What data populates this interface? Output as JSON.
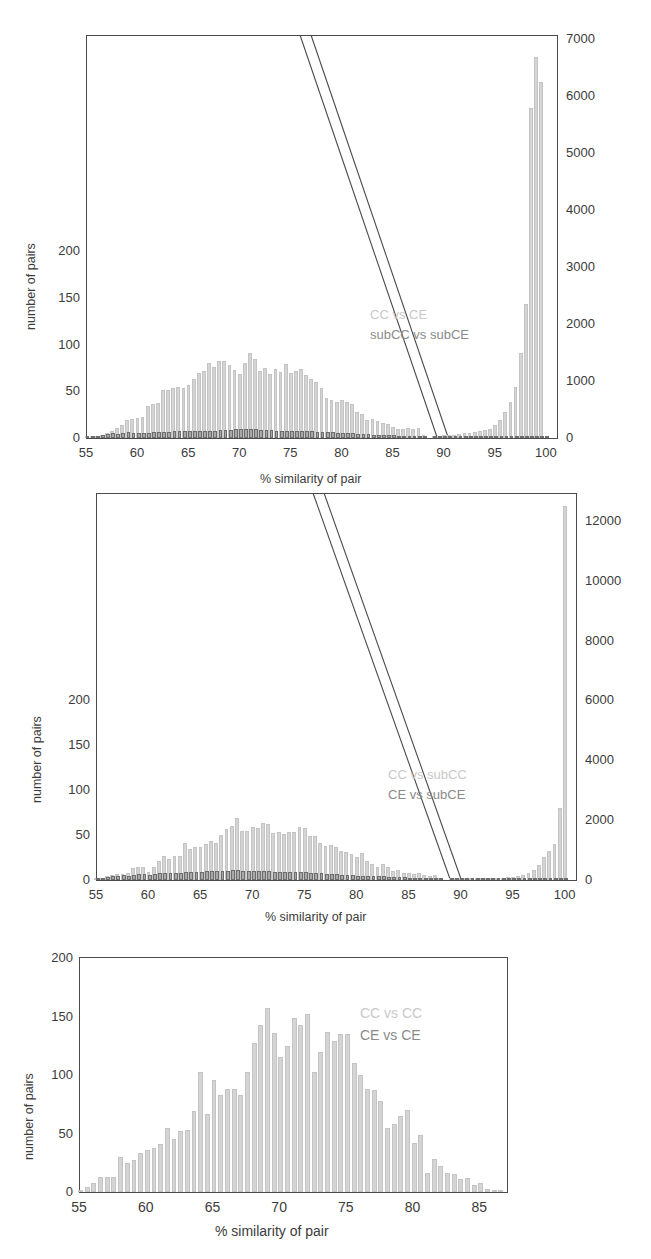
{
  "figure": {
    "axis_title_x": "% similarity of pair",
    "axis_title_y": "number of pairs"
  },
  "chart_data": [
    {
      "type": "bar",
      "panel": "top",
      "title": "",
      "xlabel": "% similarity of pair",
      "ylabel": "number of pairs",
      "xlim": [
        55,
        101
      ],
      "xticks": [
        55,
        60,
        65,
        70,
        75,
        80,
        85,
        90,
        95,
        100
      ],
      "ylim_left": [
        0,
        430
      ],
      "yticks_left": [
        0,
        50,
        100,
        150,
        200
      ],
      "ylim_right": [
        0,
        7060
      ],
      "yticks_right": [
        0,
        1000,
        2000,
        3000,
        4000,
        5000,
        6000,
        7000
      ],
      "grid": false,
      "legend_position": "inside-right",
      "legend": [
        {
          "name": "CC vs CE",
          "color": "#c9c9c9",
          "axis": "right"
        },
        {
          "name": "subCC vs subCE",
          "color": "#8a8a8a",
          "axis": "left"
        }
      ],
      "annotations": [
        "axis break between 88 and 89"
      ],
      "x": [
        55.0,
        55.5,
        56.0,
        56.5,
        57.0,
        57.5,
        58.0,
        58.5,
        59.0,
        59.5,
        60.0,
        60.5,
        61.0,
        61.5,
        62.0,
        62.5,
        63.0,
        63.5,
        64.0,
        64.5,
        65.0,
        65.5,
        66.0,
        66.5,
        67.0,
        67.5,
        68.0,
        68.5,
        69.0,
        69.5,
        70.0,
        70.5,
        71.0,
        71.5,
        72.0,
        72.5,
        73.0,
        73.5,
        74.0,
        74.5,
        75.0,
        75.5,
        76.0,
        76.5,
        77.0,
        77.5,
        78.0,
        78.5,
        79.0,
        79.5,
        80.0,
        80.5,
        81.0,
        81.5,
        82.0,
        82.5,
        83.0,
        83.5,
        84.0,
        84.5,
        85.0,
        85.5,
        86.0,
        86.5,
        87.0,
        87.5,
        88.0,
        89.0,
        89.5,
        90.0,
        90.5,
        91.0,
        91.5,
        92.0,
        92.5,
        93.0,
        93.5,
        94.0,
        94.5,
        95.0,
        95.5,
        96.0,
        96.5,
        97.0,
        97.5,
        98.0,
        98.5,
        99.0,
        99.5,
        100.0
      ],
      "series": [
        {
          "name": "CC vs CE",
          "axis": "right",
          "color": "#d4d4d4",
          "values": [
            10,
            20,
            35,
            55,
            90,
            130,
            170,
            230,
            310,
            340,
            350,
            370,
            560,
            600,
            620,
            840,
            850,
            870,
            900,
            880,
            930,
            1030,
            1150,
            1180,
            1320,
            1250,
            1360,
            1360,
            1290,
            1200,
            1120,
            1310,
            1500,
            1380,
            1170,
            1230,
            1120,
            1220,
            1160,
            1300,
            1150,
            1180,
            1220,
            1110,
            1040,
            980,
            880,
            700,
            670,
            640,
            660,
            640,
            600,
            460,
            420,
            320,
            340,
            300,
            260,
            240,
            190,
            160,
            160,
            180,
            150,
            170,
            60,
            30,
            40,
            50,
            55,
            60,
            70,
            80,
            90,
            110,
            120,
            140,
            160,
            230,
            310,
            460,
            640,
            900,
            1500,
            2350,
            5800,
            6700,
            6250
          ]
        },
        {
          "name": "subCC vs subCE",
          "axis": "left",
          "color": "#a8a8a8",
          "values": [
            0.5,
            1,
            2,
            3,
            4,
            5,
            4,
            5,
            6,
            5,
            5,
            5,
            5,
            6,
            6,
            6,
            6,
            7,
            7,
            7,
            7,
            8,
            8,
            8,
            8,
            8,
            9,
            9,
            9,
            10,
            10,
            10,
            10,
            10,
            9,
            9,
            9,
            8,
            8,
            8,
            8,
            8,
            7,
            7,
            7,
            6,
            6,
            6,
            6,
            5,
            5,
            5,
            5,
            4,
            4,
            4,
            3,
            3,
            3,
            3,
            3,
            2,
            2,
            2,
            2,
            1,
            1,
            1,
            1,
            1,
            1,
            1,
            1,
            1,
            1,
            1,
            1,
            1,
            1,
            1,
            1,
            1,
            1,
            1,
            1,
            1,
            1,
            1,
            1,
            1
          ]
        }
      ]
    },
    {
      "type": "bar",
      "panel": "middle",
      "title": "",
      "xlabel": "% similarity of pair",
      "ylabel": "number of pairs",
      "xlim": [
        55,
        101
      ],
      "xticks": [
        55,
        60,
        65,
        70,
        75,
        80,
        85,
        90,
        95,
        100
      ],
      "ylim_left": [
        0,
        430
      ],
      "yticks_left": [
        0,
        50,
        100,
        150,
        200
      ],
      "ylim_right": [
        0,
        12900
      ],
      "yticks_right": [
        0,
        2000,
        4000,
        6000,
        8000,
        10000,
        12000
      ],
      "grid": false,
      "legend_position": "inside-right",
      "legend": [
        {
          "name": "CC vs subCC",
          "color": "#c9c9c9",
          "axis": "right"
        },
        {
          "name": "CE vs subCE",
          "color": "#8a8a8a",
          "axis": "left"
        }
      ],
      "annotations": [
        "axis break between 88 and 89"
      ],
      "x": [
        55.0,
        55.5,
        56.0,
        56.5,
        57.0,
        57.5,
        58.0,
        58.5,
        59.0,
        59.5,
        60.0,
        60.5,
        61.0,
        61.5,
        62.0,
        62.5,
        63.0,
        63.5,
        64.0,
        64.5,
        65.0,
        65.5,
        66.0,
        66.5,
        67.0,
        67.5,
        68.0,
        68.5,
        69.0,
        69.5,
        70.0,
        70.5,
        71.0,
        71.5,
        72.0,
        72.5,
        73.0,
        73.5,
        74.0,
        74.5,
        75.0,
        75.5,
        76.0,
        76.5,
        77.0,
        77.5,
        78.0,
        78.5,
        79.0,
        79.5,
        80.0,
        80.5,
        81.0,
        81.5,
        82.0,
        82.5,
        83.0,
        83.5,
        84.0,
        84.5,
        85.0,
        85.5,
        86.0,
        86.5,
        87.0,
        87.5,
        88.0,
        89.0,
        89.5,
        90.0,
        90.5,
        91.0,
        91.5,
        92.0,
        92.5,
        93.0,
        93.5,
        94.0,
        94.5,
        95.0,
        95.5,
        96.0,
        96.5,
        97.0,
        97.5,
        98.0,
        98.5,
        99.0,
        99.5,
        100.0
      ],
      "series": [
        {
          "name": "CC vs subCC",
          "axis": "right",
          "color": "#d4d4d4",
          "values": [
            5,
            40,
            120,
            170,
            200,
            210,
            250,
            400,
            430,
            420,
            280,
            430,
            640,
            790,
            700,
            800,
            790,
            1250,
            1050,
            1100,
            1110,
            1210,
            1290,
            1230,
            1490,
            1720,
            1820,
            2060,
            1630,
            1650,
            1780,
            1730,
            1900,
            1860,
            1560,
            1620,
            1540,
            1590,
            1600,
            1760,
            1730,
            1470,
            1470,
            1250,
            1140,
            1160,
            1100,
            980,
            930,
            880,
            770,
            910,
            620,
            520,
            440,
            550,
            420,
            300,
            350,
            240,
            250,
            200,
            230,
            160,
            140,
            170,
            30,
            25,
            25,
            30,
            30,
            35,
            40,
            45,
            50,
            60,
            70,
            80,
            90,
            110,
            140,
            180,
            250,
            340,
            500,
            760,
            980,
            1200,
            2400,
            12500
          ]
        },
        {
          "name": "CE vs subCE",
          "axis": "left",
          "color": "#a8a8a8",
          "values": [
            1,
            2,
            3,
            4,
            5,
            6,
            5,
            6,
            7,
            7,
            6,
            7,
            8,
            8,
            8,
            8,
            8,
            9,
            9,
            9,
            9,
            10,
            10,
            10,
            10,
            10,
            11,
            11,
            10,
            10,
            10,
            10,
            10,
            10,
            9,
            9,
            9,
            9,
            9,
            9,
            9,
            8,
            8,
            8,
            7,
            7,
            7,
            6,
            6,
            6,
            5,
            5,
            5,
            4,
            4,
            4,
            3,
            3,
            3,
            3,
            2,
            2,
            2,
            2,
            2,
            2,
            1,
            1,
            1,
            1,
            1,
            1,
            1,
            1,
            1,
            1,
            1,
            1,
            1,
            1,
            1,
            1,
            1,
            1,
            1,
            1,
            1,
            1,
            1,
            1
          ]
        }
      ]
    },
    {
      "type": "bar",
      "panel": "bottom",
      "title": "",
      "xlabel": "% similarity of pair",
      "ylabel": "number of pairs",
      "xlim": [
        55,
        87
      ],
      "xticks": [
        55,
        60,
        65,
        70,
        75,
        80,
        85
      ],
      "ylim_left": [
        0,
        200
      ],
      "yticks_left": [
        0,
        50,
        100,
        150,
        200
      ],
      "grid": false,
      "legend_position": "inside-right",
      "legend": [
        {
          "name": "CC vs CC",
          "color": "#c9c9c9",
          "axis": "left"
        },
        {
          "name": "CE vs CE",
          "color": "#8a8a8a",
          "axis": "left"
        }
      ],
      "x": [
        55.0,
        55.5,
        56.0,
        56.5,
        57.0,
        57.5,
        58.0,
        58.5,
        59.0,
        59.5,
        60.0,
        60.5,
        61.0,
        61.5,
        62.0,
        62.5,
        63.0,
        63.5,
        64.0,
        64.5,
        65.0,
        65.5,
        66.0,
        66.5,
        67.0,
        67.5,
        68.0,
        68.5,
        69.0,
        69.5,
        70.0,
        70.5,
        71.0,
        71.5,
        72.0,
        72.5,
        73.0,
        73.5,
        74.0,
        74.5,
        75.0,
        75.5,
        76.0,
        76.5,
        77.0,
        77.5,
        78.0,
        78.5,
        79.0,
        79.5,
        80.0,
        80.5,
        81.0,
        81.5,
        82.0,
        82.5,
        83.0,
        83.5,
        84.0,
        84.5,
        85.0,
        85.5,
        86.0,
        86.5
      ],
      "series": [
        {
          "name": "CC vs CC / CE vs CE",
          "axis": "left",
          "color": "#c8c8c8",
          "values": [
            2,
            4,
            8,
            13,
            13,
            13,
            30,
            25,
            27,
            33,
            36,
            38,
            41,
            55,
            45,
            52,
            53,
            69,
            103,
            67,
            96,
            83,
            88,
            88,
            83,
            103,
            127,
            143,
            157,
            136,
            115,
            125,
            149,
            143,
            152,
            103,
            120,
            137,
            129,
            135,
            135,
            110,
            100,
            88,
            87,
            78,
            55,
            58,
            65,
            70,
            42,
            49,
            16,
            28,
            22,
            16,
            15,
            11,
            12,
            6,
            8,
            3,
            2,
            2
          ]
        }
      ]
    }
  ]
}
